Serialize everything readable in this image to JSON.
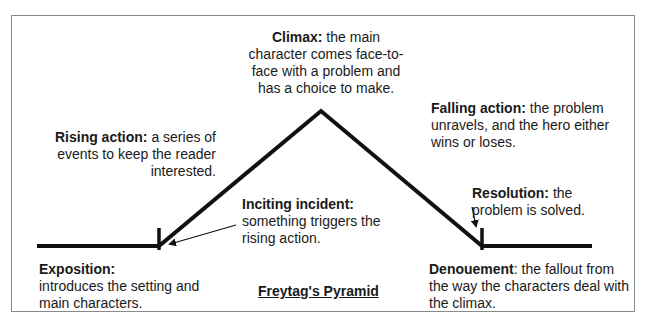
{
  "diagram": {
    "title": "Freytag's Pyramid",
    "cut_off_top_text": "·  · ·   ·   ·       ·   ·",
    "labels": {
      "climax": {
        "term": "Climax:",
        "text": " the main character comes face-to-face with a problem and has a choice to make."
      },
      "rising_action": {
        "term": "Rising action:",
        "text": " a series of events to keep the reader interested."
      },
      "falling_action": {
        "term": "Falling action:",
        "text": " the problem unravels, and the hero either wins or loses."
      },
      "inciting_incident": {
        "term": "Inciting incident:",
        "text": " something triggers the rising action."
      },
      "resolution": {
        "term": "Resolution:",
        "text": " the problem is solved."
      },
      "exposition": {
        "term": "Exposition:",
        "text": " introduces the setting and main characters."
      },
      "denouement": {
        "term": "Denouement",
        "text": ": the fallout from the way the characters deal with the climax."
      }
    },
    "colors": {
      "line": "#111111",
      "frame": "#8a8a8a",
      "text": "#1a1a1a"
    }
  }
}
